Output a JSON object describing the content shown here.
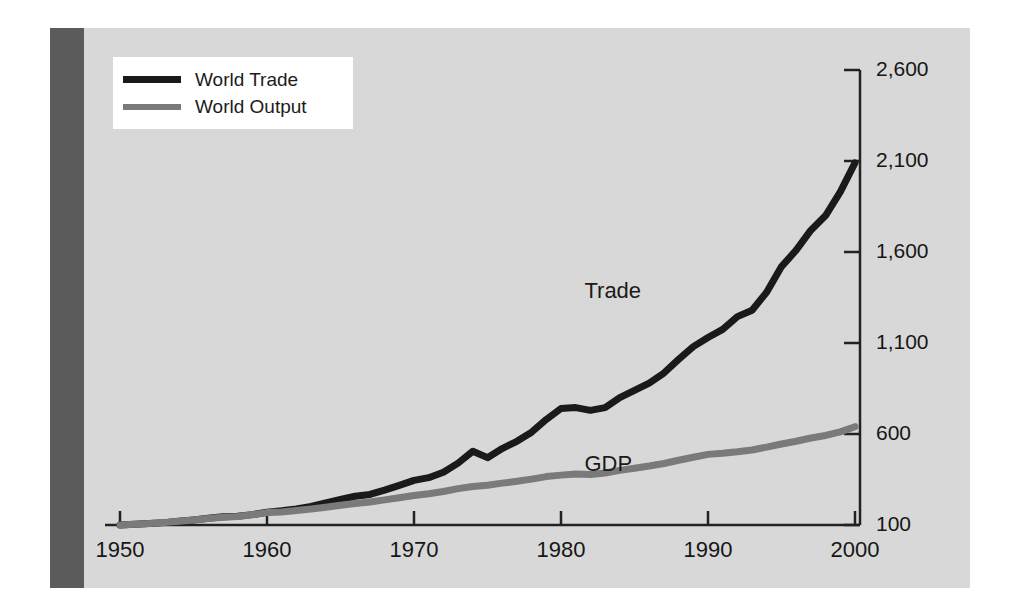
{
  "figure": {
    "background_color": "#d8d8d8",
    "side_bar_color": "#5b5b5b",
    "page_color": "#ffffff"
  },
  "legend": {
    "position": "top-left",
    "background_color": "#ffffff",
    "entries": [
      {
        "label": "World Trade",
        "color": "#1a1a1a",
        "key": "trade"
      },
      {
        "label": "World Output",
        "color": "#7a7a7a",
        "key": "output"
      }
    ]
  },
  "annotations": [
    {
      "text": "Trade",
      "x": 1983.5,
      "y": 1380
    },
    {
      "text": "GDP",
      "x": 1983.5,
      "y": 430
    }
  ],
  "chart_data": {
    "type": "line",
    "title": "",
    "subtitle": "",
    "xlabel": "",
    "ylabel": "",
    "xlim": [
      1950,
      2000
    ],
    "ylim": [
      100,
      2600
    ],
    "grid": false,
    "legend_position": "top-left",
    "y_axis_side": "right",
    "xticks": [
      1950,
      1960,
      1970,
      1980,
      1990,
      2000
    ],
    "xticklabels": [
      "1950",
      "1960",
      "1970",
      "1980",
      "1990",
      "2000"
    ],
    "yticks": [
      100,
      600,
      1100,
      1600,
      2100,
      2600
    ],
    "yticklabels": [
      "100",
      "600",
      "1,100",
      "1,600",
      "2,100",
      "2,600"
    ],
    "x": [
      1950,
      1951,
      1952,
      1953,
      1954,
      1955,
      1956,
      1957,
      1958,
      1959,
      1960,
      1961,
      1962,
      1963,
      1964,
      1965,
      1966,
      1967,
      1968,
      1969,
      1970,
      1971,
      1972,
      1973,
      1974,
      1975,
      1976,
      1977,
      1978,
      1979,
      1980,
      1981,
      1982,
      1983,
      1984,
      1985,
      1986,
      1987,
      1988,
      1989,
      1990,
      1991,
      1992,
      1993,
      1994,
      1995,
      1996,
      1997,
      1998,
      1999,
      2000
    ],
    "series": [
      {
        "name": "World Trade",
        "color": "#1a1a1a",
        "linewidth": 7,
        "values": [
          100,
          104,
          108,
          113,
          120,
          128,
          137,
          145,
          148,
          157,
          170,
          178,
          188,
          202,
          222,
          240,
          258,
          268,
          292,
          318,
          345,
          360,
          390,
          440,
          505,
          470,
          520,
          560,
          610,
          680,
          740,
          745,
          730,
          745,
          800,
          840,
          880,
          935,
          1010,
          1080,
          1130,
          1175,
          1245,
          1280,
          1380,
          1520,
          1610,
          1720,
          1800,
          1930,
          2090
        ]
      },
      {
        "name": "World Output",
        "color": "#7a7a7a",
        "linewidth": 7,
        "values": [
          100,
          104,
          108,
          113,
          120,
          128,
          136,
          143,
          147,
          156,
          168,
          172,
          180,
          188,
          198,
          208,
          218,
          226,
          238,
          250,
          262,
          272,
          284,
          300,
          312,
          318,
          330,
          340,
          352,
          366,
          374,
          380,
          378,
          386,
          400,
          412,
          424,
          438,
          456,
          472,
          488,
          494,
          502,
          512,
          528,
          545,
          560,
          578,
          592,
          612,
          640
        ]
      }
    ]
  }
}
